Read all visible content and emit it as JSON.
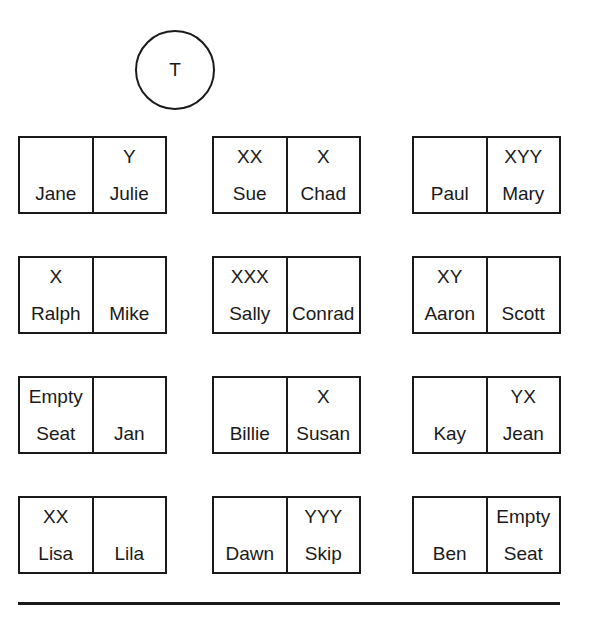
{
  "teacher": {
    "label": "T"
  },
  "rows": [
    {
      "desks": [
        {
          "seats": [
            {
              "mark": "",
              "name": "Jane"
            },
            {
              "mark": "Y",
              "name": "Julie"
            }
          ]
        },
        {
          "seats": [
            {
              "mark": "XX",
              "name": "Sue"
            },
            {
              "mark": "X",
              "name": "Chad"
            }
          ]
        },
        {
          "seats": [
            {
              "mark": "",
              "name": "Paul"
            },
            {
              "mark": "XYY",
              "name": "Mary"
            }
          ]
        }
      ]
    },
    {
      "desks": [
        {
          "seats": [
            {
              "mark": "X",
              "name": "Ralph"
            },
            {
              "mark": "",
              "name": "Mike"
            }
          ]
        },
        {
          "seats": [
            {
              "mark": "XXX",
              "name": "Sally"
            },
            {
              "mark": "",
              "name": "Conrad"
            }
          ]
        },
        {
          "seats": [
            {
              "mark": "XY",
              "name": "Aaron"
            },
            {
              "mark": "",
              "name": "Scott"
            }
          ]
        }
      ]
    },
    {
      "desks": [
        {
          "seats": [
            {
              "mark": "Empty",
              "name": "Seat"
            },
            {
              "mark": "",
              "name": "Jan"
            }
          ]
        },
        {
          "seats": [
            {
              "mark": "",
              "name": "Billie"
            },
            {
              "mark": "X",
              "name": "Susan"
            }
          ]
        },
        {
          "seats": [
            {
              "mark": "",
              "name": "Kay"
            },
            {
              "mark": "YX",
              "name": "Jean"
            }
          ]
        }
      ]
    },
    {
      "desks": [
        {
          "seats": [
            {
              "mark": "XX",
              "name": "Lisa"
            },
            {
              "mark": "",
              "name": "Lila"
            }
          ]
        },
        {
          "seats": [
            {
              "mark": "",
              "name": "Dawn"
            },
            {
              "mark": "YYY",
              "name": "Skip"
            }
          ]
        },
        {
          "seats": [
            {
              "mark": "",
              "name": "Ben"
            },
            {
              "mark": "Empty",
              "name": "Seat"
            }
          ]
        }
      ]
    }
  ]
}
